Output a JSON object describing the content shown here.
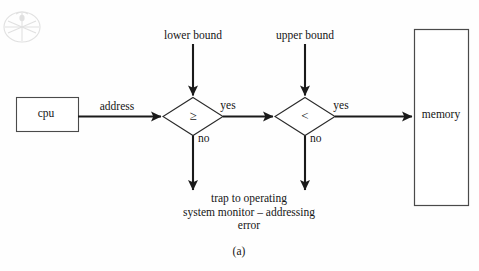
{
  "figure": {
    "caption": "(a)",
    "top_cut_text": "",
    "watermark_icon": "circular-emblem-watermark"
  },
  "nodes": {
    "cpu": {
      "label": "cpu",
      "shape": "rectangle",
      "x": 16,
      "y": 97,
      "w": 62,
      "h": 34
    },
    "memory": {
      "label": "memory",
      "shape": "rectangle",
      "x": 414,
      "y": 29,
      "w": 55,
      "h": 177
    },
    "decision_lower": {
      "label": "≥",
      "label_name": "greater-than-or-equal",
      "shape": "diamond",
      "cx": 193,
      "cy": 116,
      "w": 60,
      "h": 38
    },
    "decision_upper": {
      "label": "<",
      "label_name": "less-than",
      "shape": "diamond",
      "cx": 305,
      "cy": 116,
      "w": 60,
      "h": 38
    }
  },
  "labels": {
    "lower_bound": "lower bound",
    "upper_bound": "upper bound",
    "address": "address",
    "yes_lower": "yes",
    "yes_upper": "yes",
    "no_lower": "no",
    "no_upper": "no"
  },
  "trap_message": {
    "line1": "trap to operating",
    "line2": "system monitor – addressing",
    "line3": "error"
  },
  "colors": {
    "background": "#fefefe",
    "stroke": "#1a1a1a",
    "box_stroke": "#4a4a4a",
    "text": "#151515",
    "watermark": "#bcbcbc"
  }
}
